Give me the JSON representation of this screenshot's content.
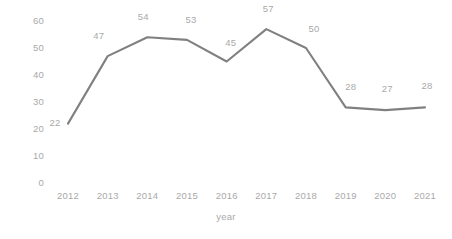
{
  "chart_data": {
    "type": "line",
    "title": "",
    "subtitle": "",
    "xlabel": "year",
    "ylabel": "",
    "categories": [
      "2012",
      "2013",
      "2014",
      "2015",
      "2016",
      "2017",
      "2018",
      "2019",
      "2020",
      "2021"
    ],
    "values": [
      22,
      47,
      54,
      53,
      45,
      57,
      50,
      28,
      27,
      28
    ],
    "series": [
      {
        "name": "",
        "values": [
          22,
          47,
          54,
          53,
          45,
          57,
          50,
          28,
          27,
          28
        ],
        "color": "#808080"
      }
    ],
    "data_labels": [
      "22",
      "47",
      "54",
      "53",
      "45",
      "57",
      "50",
      "28",
      "27",
      "28"
    ],
    "show_data_labels": true,
    "markers": false,
    "ylim": [
      0,
      60
    ],
    "ytick_labels": [
      "0",
      "10",
      "20",
      "30",
      "40",
      "50",
      "60"
    ],
    "ytick_values": [
      0,
      10,
      20,
      30,
      40,
      50,
      60
    ],
    "xtick_labels": [
      "2012",
      "2013",
      "2014",
      "2015",
      "2016",
      "2017",
      "2018",
      "2019",
      "2020",
      "2021"
    ],
    "grid": false,
    "axis_lines": false,
    "legend": false,
    "legend_position": "none",
    "colors": {
      "line": "#808080",
      "tick_text": "#a9a9a9",
      "label_text": "#a9a9a9",
      "background": "#ffffff"
    }
  }
}
